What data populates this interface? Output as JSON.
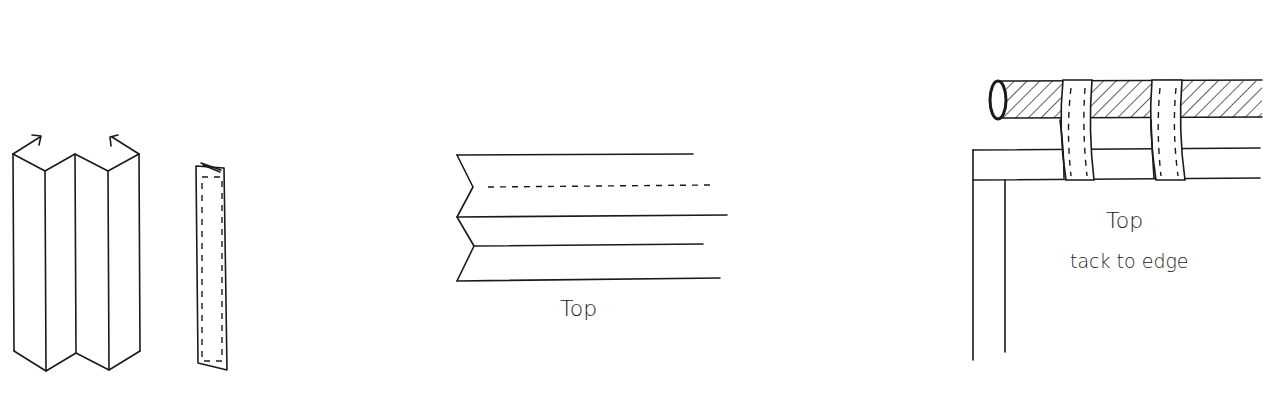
{
  "figures": [
    {
      "id": "pleated-panel",
      "description": "accordion-folded fabric panel with fold arrows"
    },
    {
      "id": "folded-strip",
      "description": "folded strip with stitch line"
    },
    {
      "id": "pleat-top-view",
      "label": "Top"
    },
    {
      "id": "rod-mount",
      "label": "Top",
      "note": "tack to edge"
    }
  ],
  "colors": {
    "ink": "#1a1a1a",
    "background": "#ffffff"
  }
}
